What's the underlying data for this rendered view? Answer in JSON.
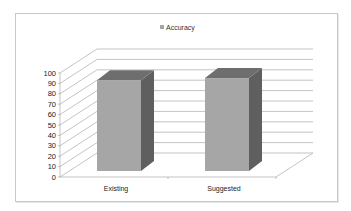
{
  "chart_data": {
    "type": "bar",
    "style": "3d-column",
    "title": "",
    "xlabel": "",
    "ylabel": "",
    "categories": [
      "Existing",
      "Suggested"
    ],
    "series": [
      {
        "name": "Accuracy",
        "values": [
          96,
          98
        ],
        "color": "#a6a6a6"
      }
    ],
    "ylim": [
      0,
      100
    ],
    "yticks": [
      "0",
      "10",
      "20",
      "30",
      "40",
      "50",
      "60",
      "70",
      "80",
      "90",
      "100"
    ],
    "grid": true,
    "legend_position": "top"
  },
  "legend": {
    "label": "Accuracy"
  },
  "colors": {
    "bar_front": "#a6a6a6",
    "bar_top": "#6e6e6e",
    "bar_side": "#5f5f5f",
    "grid": "#9a9a9a",
    "frame": "#c8c8c8"
  }
}
